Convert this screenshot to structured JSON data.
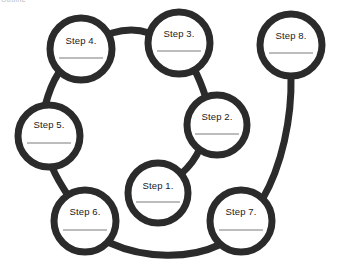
{
  "page": {
    "header_fragment": "Outline",
    "background_color": "#ffffff",
    "width": 339,
    "height": 265
  },
  "diagram": {
    "type": "cycle-process-diagram",
    "stroke_color": "#2b2b2b",
    "node_fill_color": "#ffffff",
    "node_stroke_width": 7,
    "connector_stroke_width": 7,
    "writeline_color": "#7a7a7a",
    "nodes": [
      {
        "id": "step-1",
        "label": "Step 1.",
        "cx": 158,
        "cy": 193,
        "r": 30,
        "label_dy": -7,
        "writeline_dy": 9,
        "writeline_half_width": 22
      },
      {
        "id": "step-2",
        "label": "Step 2.",
        "cx": 217,
        "cy": 125,
        "r": 30,
        "label_dy": -8,
        "writeline_dy": 9,
        "writeline_half_width": 22
      },
      {
        "id": "step-3",
        "label": "Step 3.",
        "cx": 179,
        "cy": 43,
        "r": 31,
        "label_dy": -9,
        "writeline_dy": 8,
        "writeline_half_width": 22
      },
      {
        "id": "step-4",
        "label": "Step 4.",
        "cx": 81,
        "cy": 49,
        "r": 31,
        "label_dy": -8,
        "writeline_dy": 9,
        "writeline_half_width": 22
      },
      {
        "id": "step-5",
        "label": "Step 5.",
        "cx": 49,
        "cy": 136,
        "r": 31,
        "label_dy": -11,
        "writeline_dy": 7,
        "writeline_half_width": 22
      },
      {
        "id": "step-6",
        "label": "Step 6.",
        "cx": 85,
        "cy": 221,
        "r": 31,
        "label_dy": -9,
        "writeline_dy": 9,
        "writeline_half_width": 22
      },
      {
        "id": "step-7",
        "label": "Step 7.",
        "cx": 241,
        "cy": 221,
        "r": 31,
        "label_dy": -9,
        "writeline_dy": 9,
        "writeline_half_width": 22
      },
      {
        "id": "step-8",
        "label": "Step 8.",
        "cx": 291,
        "cy": 45,
        "r": 31,
        "label_dy": -9,
        "writeline_dy": 8,
        "writeline_half_width": 22
      }
    ],
    "connectors": [
      {
        "id": "link-1-2",
        "from": "step-1",
        "to": "step-2",
        "path": "M 181 174 C 190 166 196 158 200 148"
      },
      {
        "id": "link-2-3",
        "from": "step-2",
        "to": "step-3",
        "path": "M 206 98 C 202 86 198 76 194 69"
      },
      {
        "id": "link-3-4",
        "from": "step-3",
        "to": "step-4",
        "path": "M 149 33 C 138 29 125 29 112 33"
      },
      {
        "id": "link-4-5",
        "from": "step-4",
        "to": "step-5",
        "path": "M 58 74 C 52 83 48 95 45 106"
      },
      {
        "id": "link-5-6",
        "from": "step-5",
        "to": "step-6",
        "path": "M 52 167 C 57 179 63 188 69 197"
      },
      {
        "id": "link-6-7",
        "from": "step-6",
        "to": "step-7",
        "path": "M 110 243 C 145 259 190 259 219 245"
      },
      {
        "id": "link-8-7",
        "from": "step-8",
        "to": "step-7",
        "path": "M 291 76 C 292 118 282 166 262 200"
      }
    ]
  }
}
